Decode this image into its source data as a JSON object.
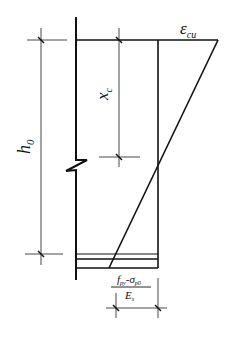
{
  "diagram": {
    "labels": {
      "epsilon_cu": {
        "main": "ε",
        "sub": "cu"
      },
      "x_c": {
        "main": "x",
        "sub": "c"
      },
      "h_0": {
        "main": "h",
        "sub": "0"
      },
      "strain_steel": {
        "numerator_f": "f",
        "numerator_f_sub": "py",
        "numerator_minus": "-",
        "numerator_sigma": "σ",
        "numerator_sigma_sub": "p0",
        "denominator_E": "E",
        "denominator_E_sub": "s"
      }
    },
    "colors": {
      "line": "#111111",
      "thin_line": "#333333",
      "background": "#ffffff"
    }
  }
}
